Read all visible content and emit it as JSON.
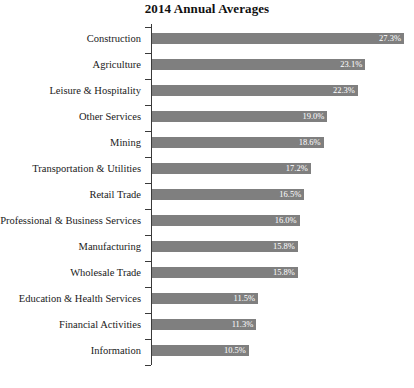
{
  "chart_data": {
    "type": "bar",
    "orientation": "horizontal",
    "title": "2014 Annual Averages",
    "xlabel": "",
    "ylabel": "",
    "categories": [
      "Construction",
      "Agriculture",
      "Leisure & Hospitality",
      "Other Services",
      "Mining",
      "Transportation & Utilities",
      "Retail Trade",
      "Professional & Business Services",
      "Manufacturing",
      "Wholesale Trade",
      "Education & Health Services",
      "Financial Activities",
      "Information"
    ],
    "values": [
      27.3,
      23.1,
      22.3,
      19.0,
      18.6,
      17.2,
      16.5,
      16.0,
      15.8,
      15.8,
      11.5,
      11.3,
      10.5
    ],
    "value_labels": [
      "27.3%",
      "23.1%",
      "22.3%",
      "19.0%",
      "18.6%",
      "17.2%",
      "16.5%",
      "16.0%",
      "15.8%",
      "15.8%",
      "11.5%",
      "11.3%",
      "10.5%"
    ],
    "xlim": [
      0,
      27.3
    ],
    "grid": false,
    "legend": null,
    "bar_color": "#7f7f7f",
    "value_label_color": "#ffffff",
    "axis_color": "#3a3a3a"
  }
}
